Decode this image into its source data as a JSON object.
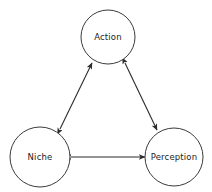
{
  "diagram": {
    "type": "cycle-triangle",
    "background_color": "#ffffff",
    "node_stroke_color": "#3b3b3b",
    "node_fill_color": "#ffffff",
    "edge_color": "#2b2b2b",
    "label_color": "#1d1d1d",
    "nodes": [
      {
        "id": "action",
        "label": "Action",
        "cx": 108,
        "cy": 37,
        "r": 27
      },
      {
        "id": "niche",
        "label": "Niche",
        "cx": 40,
        "cy": 157,
        "r": 30
      },
      {
        "id": "perception",
        "label": "Perception",
        "cx": 174,
        "cy": 157,
        "r": 29
      }
    ],
    "edges": [
      {
        "id": "niche-action",
        "from": "niche",
        "to": "action",
        "direction": "bidirectional",
        "x1": 60,
        "y1": 129,
        "x2": 92,
        "y2": 63
      },
      {
        "id": "action-perception",
        "from": "action",
        "to": "perception",
        "direction": "bidirectional",
        "x1": 125,
        "y1": 63,
        "x2": 157,
        "y2": 130
      },
      {
        "id": "niche-perception",
        "from": "niche",
        "to": "perception",
        "direction": "bidirectional",
        "x1": 71,
        "y1": 157,
        "x2": 145,
        "y2": 157
      }
    ]
  }
}
